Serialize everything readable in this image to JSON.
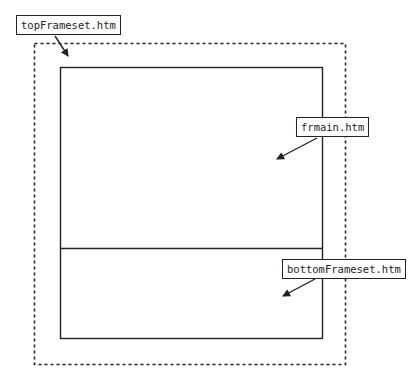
{
  "diagram": {
    "labels": {
      "top": "topFrameset.htm",
      "main": "frmain.htm",
      "bottom": "bottomFrameset.htm"
    },
    "colors": {
      "stroke": "#222222",
      "background": "#ffffff"
    }
  }
}
